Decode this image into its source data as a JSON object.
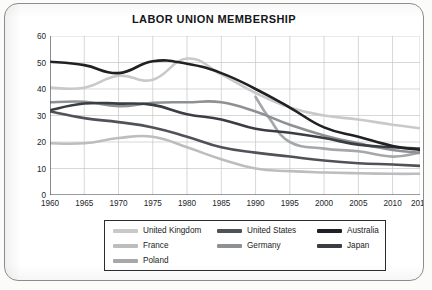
{
  "chart_data": {
    "type": "line",
    "title": "LABOR UNION MEMBERSHIP",
    "xlabel": "",
    "ylabel": "PERCENTAGE OF LABOR FORCE",
    "xlim": [
      1960,
      2014
    ],
    "ylim": [
      0,
      60
    ],
    "grid": true,
    "legend_position": "bottom",
    "x_ticks": [
      "1960",
      "1965",
      "1970",
      "1975",
      "1980",
      "1985",
      "1990",
      "1995",
      "2000",
      "2005",
      "2010",
      "2014"
    ],
    "x_tick_values": [
      1960,
      1965,
      1970,
      1975,
      1980,
      1985,
      1990,
      1995,
      2000,
      2005,
      2010,
      2014
    ],
    "y_ticks": [
      "0",
      "10",
      "20",
      "30",
      "40",
      "50",
      "60"
    ],
    "y_tick_values": [
      0,
      10,
      20,
      30,
      40,
      50,
      60
    ],
    "series": [
      {
        "name": "United Kingdom",
        "color": "#c9c9c9",
        "x": [
          1960,
          1965,
          1970,
          1975,
          1980,
          1985,
          1990,
          1995,
          2000,
          2005,
          2010,
          2014
        ],
        "values": [
          40.5,
          40.5,
          45.0,
          43.5,
          51.5,
          45.5,
          38.5,
          33.0,
          30.0,
          28.5,
          26.5,
          25.2
        ]
      },
      {
        "name": "United States",
        "color": "#4f5257",
        "x": [
          1960,
          1965,
          1970,
          1975,
          1980,
          1985,
          1990,
          1995,
          2000,
          2005,
          2010,
          2014
        ],
        "values": [
          31.5,
          29.0,
          27.5,
          25.5,
          22.0,
          18.0,
          16.0,
          14.5,
          13.0,
          12.0,
          11.5,
          11.0
        ]
      },
      {
        "name": "Australia",
        "color": "#1f2124",
        "x": [
          1960,
          1965,
          1970,
          1975,
          1980,
          1985,
          1990,
          1995,
          2000,
          2005,
          2010,
          2014
        ],
        "values": [
          50.3,
          49.0,
          46.0,
          50.5,
          49.5,
          46.0,
          40.0,
          33.0,
          25.5,
          22.0,
          18.5,
          17.0
        ]
      },
      {
        "name": "France",
        "color": "#bdbdbd",
        "x": [
          1960,
          1965,
          1970,
          1975,
          1980,
          1985,
          1990,
          1995,
          2000,
          2005,
          2010,
          2014
        ],
        "values": [
          19.5,
          19.5,
          21.5,
          22.0,
          18.0,
          13.5,
          10.0,
          9.0,
          8.5,
          8.2,
          8.0,
          8.0
        ]
      },
      {
        "name": "Germany",
        "color": "#8e9194",
        "x": [
          1960,
          1965,
          1970,
          1975,
          1980,
          1985,
          1990,
          1995,
          2000,
          2005,
          2010,
          2014
        ],
        "values": [
          35.0,
          35.2,
          33.5,
          34.8,
          35.0,
          35.0,
          31.5,
          26.5,
          22.5,
          19.5,
          17.0,
          16.0
        ]
      },
      {
        "name": "Japan",
        "color": "#3a3d42",
        "x": [
          1960,
          1965,
          1970,
          1975,
          1980,
          1985,
          1990,
          1995,
          2000,
          2005,
          2010,
          2014
        ],
        "values": [
          32.0,
          34.5,
          34.5,
          34.0,
          30.5,
          28.5,
          25.0,
          23.5,
          21.5,
          19.0,
          18.0,
          17.5
        ]
      },
      {
        "name": "Poland",
        "color": "#a5a7aa",
        "x": [
          1990,
          1992,
          1995,
          2000,
          2005,
          2010,
          2014
        ],
        "values": [
          37.0,
          29.0,
          20.0,
          17.5,
          16.5,
          14.5,
          16.0
        ]
      }
    ]
  },
  "legend": {
    "items": [
      {
        "label": "United Kingdom"
      },
      {
        "label": "United States"
      },
      {
        "label": "Australia"
      },
      {
        "label": "France"
      },
      {
        "label": "Germany"
      },
      {
        "label": "Japan"
      },
      {
        "label": "Poland"
      }
    ]
  },
  "caption": ""
}
